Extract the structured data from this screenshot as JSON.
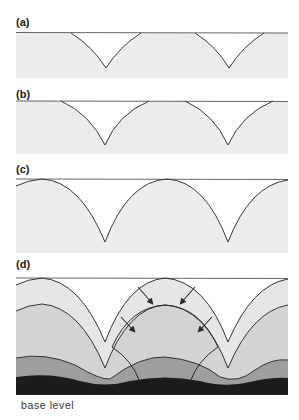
{
  "figure": {
    "panels": [
      {
        "label": "(a)",
        "description": "Two small V-shaped depressions cut into a flat surface"
      },
      {
        "label": "(b)",
        "description": "Depressions widened and deepened, separated by flat remnants"
      },
      {
        "label": "(c)",
        "description": "Depressions meet, leaving rounded ridges between valleys"
      },
      {
        "label": "(d)",
        "description": "Successive surfaces lowered toward base level, arrows show inward slope retreat"
      }
    ],
    "caption": "base level",
    "colors": {
      "ground_light": "#ececec",
      "zone_1": "#e4e4e4",
      "zone_2": "#d2d2d2",
      "zone_3": "#9a9a9a",
      "base": "#1c1c1c",
      "line": "#3a3a3a"
    }
  }
}
